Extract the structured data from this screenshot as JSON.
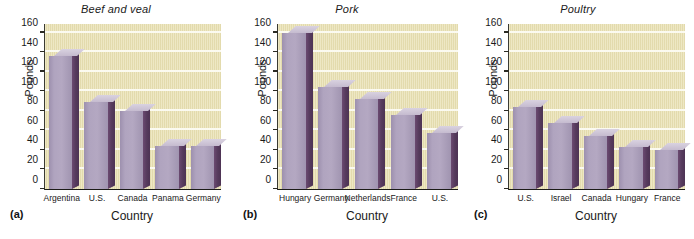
{
  "figure": {
    "width": 694,
    "height": 239,
    "background": "#ffffff",
    "plot_background": "#e9e1b4",
    "gridline_color": "#fbfaf0",
    "bar_front_color": "#b0a4bf",
    "bar_side_color": "#553a5c",
    "bar_top_color": "#cdc4d8",
    "axis_color": "#1c1c18"
  },
  "shared": {
    "ylabel": "Pounds",
    "xlabel": "Country",
    "yticks": [
      0,
      20,
      40,
      60,
      80,
      100,
      120,
      140,
      160
    ],
    "ylim": [
      0,
      170
    ]
  },
  "panels": [
    {
      "tag": "(a)",
      "title": "Beef and veal",
      "ylabel": "Pounds",
      "xlabel": "Country"
    },
    {
      "tag": "(b)",
      "title": "Pork",
      "ylabel": "Pounds",
      "xlabel": "Country"
    },
    {
      "tag": "(c)",
      "title": "Poultry",
      "ylabel": "Pounds",
      "xlabel": "Country"
    }
  ],
  "chart_data": [
    {
      "type": "bar",
      "title": "Beef and veal",
      "xlabel": "Country",
      "ylabel": "Pounds",
      "ylim": [
        0,
        170
      ],
      "yticks": [
        0,
        20,
        40,
        60,
        80,
        100,
        120,
        140,
        160
      ],
      "grid": true,
      "legend": null,
      "categories": [
        "Argentina",
        "U.S.",
        "Canada",
        "Panama",
        "Germany"
      ],
      "values": [
        136,
        89,
        80,
        44,
        44
      ]
    },
    {
      "type": "bar",
      "title": "Pork",
      "xlabel": "Country",
      "ylabel": "Pounds",
      "ylim": [
        0,
        170
      ],
      "yticks": [
        0,
        20,
        40,
        60,
        80,
        100,
        120,
        140,
        160
      ],
      "grid": true,
      "legend": null,
      "categories": [
        "Hungary",
        "Germany",
        "Netherlands",
        "France",
        "U.S."
      ],
      "values": [
        160,
        104,
        92,
        76,
        57
      ]
    },
    {
      "type": "bar",
      "title": "Poultry",
      "xlabel": "Country",
      "ylabel": "Pounds",
      "ylim": [
        0,
        170
      ],
      "yticks": [
        0,
        20,
        40,
        60,
        80,
        100,
        120,
        140,
        160
      ],
      "grid": true,
      "legend": null,
      "categories": [
        "U.S.",
        "Israel",
        "Canada",
        "Hungary",
        "France"
      ],
      "values": [
        84,
        68,
        54,
        43,
        40
      ]
    }
  ]
}
